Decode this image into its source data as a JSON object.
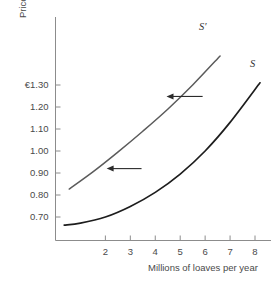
{
  "chart_data": {
    "type": "line",
    "title": "",
    "xlabel": "Millions of loaves per year",
    "ylabel": "Price per loaf",
    "xlim": [
      0,
      9
    ],
    "ylim": [
      0.62,
      1.52
    ],
    "grid": false,
    "legend_position": "inline-curve-labels",
    "x_ticks": [
      "2",
      "3",
      "4",
      "5",
      "6",
      "7",
      "8"
    ],
    "x_tick_values": [
      2,
      3,
      4,
      5,
      6,
      7,
      8
    ],
    "y_ticks": [
      "€1.30",
      "1.20",
      "1.10",
      "1.00",
      "0.90",
      "0.80",
      "0.70"
    ],
    "y_tick_values": [
      1.3,
      1.2,
      1.1,
      1.0,
      0.9,
      0.8,
      0.7
    ],
    "series": [
      {
        "name": "S",
        "label": "S",
        "color": "#1d1d1d",
        "points": [
          [
            0.35,
            0.663
          ],
          [
            1.0,
            0.672
          ],
          [
            2.0,
            0.7
          ],
          [
            3.0,
            0.748
          ],
          [
            4.0,
            0.812
          ],
          [
            5.0,
            0.895
          ],
          [
            6.0,
            1.0
          ],
          [
            7.0,
            1.13
          ],
          [
            8.2,
            1.31
          ]
        ]
      },
      {
        "name": "S'",
        "label": "S′",
        "color": "#5b5b5b",
        "points": [
          [
            0.55,
            0.827
          ],
          [
            1.5,
            0.905
          ],
          [
            2.5,
            0.995
          ],
          [
            3.5,
            1.09
          ],
          [
            4.5,
            1.19
          ],
          [
            5.5,
            1.3
          ],
          [
            6.6,
            1.432
          ]
        ]
      }
    ],
    "annotations": [
      {
        "name": "shift-arrow-upper",
        "direction": "left",
        "from": [
          5.9,
          1.248
        ],
        "to": [
          4.45,
          1.248
        ]
      },
      {
        "name": "shift-arrow-lower",
        "direction": "left",
        "from": [
          3.45,
          0.92
        ],
        "to": [
          2.05,
          0.92
        ]
      }
    ]
  }
}
